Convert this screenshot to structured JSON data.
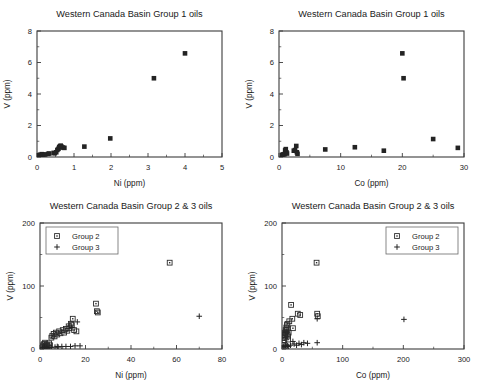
{
  "figure": {
    "width": 483,
    "height": 386,
    "background": "#ffffff",
    "marker_color": "#232323",
    "axis_color": "#3b3b3b"
  },
  "chart_data": [
    {
      "id": "panel-top-left",
      "type": "scatter",
      "title": "Western Canada Basin Group 1 oils",
      "xlabel": "Ni (ppm)",
      "ylabel": "V (ppm)",
      "xlim": [
        0,
        5
      ],
      "ylim": [
        0,
        8
      ],
      "xticks": [
        0,
        1,
        2,
        3,
        4,
        5
      ],
      "yticks": [
        0,
        2,
        4,
        6,
        8
      ],
      "xticklabels": [
        "0",
        "1",
        "2",
        "3",
        "4",
        "5"
      ],
      "yticklabels": [
        "0",
        "2",
        "4",
        "6",
        "8"
      ],
      "xminor_count": 1,
      "yminor_count": 1,
      "grid": false,
      "legend": null,
      "series": [
        {
          "name": "Group 1",
          "marker": "filled-square",
          "points": [
            [
              0.05,
              0.12
            ],
            [
              0.09,
              0.14
            ],
            [
              0.13,
              0.18
            ],
            [
              0.17,
              0.15
            ],
            [
              0.22,
              0.16
            ],
            [
              0.3,
              0.2
            ],
            [
              0.33,
              0.22
            ],
            [
              0.45,
              0.26
            ],
            [
              0.48,
              0.24
            ],
            [
              0.52,
              0.3
            ],
            [
              0.55,
              0.45
            ],
            [
              0.58,
              0.52
            ],
            [
              0.6,
              0.62
            ],
            [
              0.62,
              0.68
            ],
            [
              0.64,
              0.72
            ],
            [
              0.66,
              0.66
            ],
            [
              0.7,
              0.6
            ],
            [
              0.74,
              0.58
            ],
            [
              1.28,
              0.66
            ],
            [
              1.98,
              1.18
            ],
            [
              3.16,
              5.0
            ],
            [
              4.0,
              6.58
            ]
          ]
        }
      ]
    },
    {
      "id": "panel-top-right",
      "type": "scatter",
      "title": "Western Canada Basin Group 1 oils",
      "xlabel": "Co (ppm)",
      "ylabel": "V (ppm)",
      "xlim": [
        0,
        30
      ],
      "ylim": [
        0,
        8
      ],
      "xticks": [
        0,
        10,
        20,
        30
      ],
      "yticks": [
        0,
        2,
        4,
        6,
        8
      ],
      "xticklabels": [
        "0",
        "10",
        "20",
        "30"
      ],
      "yticklabels": [
        "0",
        "2",
        "4",
        "6",
        "8"
      ],
      "xminor_count": 1,
      "yminor_count": 1,
      "grid": false,
      "legend": null,
      "series": [
        {
          "name": "Group 1",
          "marker": "filled-square",
          "points": [
            [
              0.5,
              0.14
            ],
            [
              0.7,
              0.16
            ],
            [
              0.9,
              0.18
            ],
            [
              1.0,
              0.42
            ],
            [
              1.1,
              0.5
            ],
            [
              1.2,
              0.3
            ],
            [
              1.3,
              0.22
            ],
            [
              2.4,
              0.4
            ],
            [
              2.6,
              0.44
            ],
            [
              2.8,
              0.7
            ],
            [
              2.9,
              0.3
            ],
            [
              3.0,
              0.2
            ],
            [
              7.5,
              0.48
            ],
            [
              12.3,
              0.62
            ],
            [
              17.0,
              0.4
            ],
            [
              20.0,
              6.58
            ],
            [
              20.2,
              5.0
            ],
            [
              25.0,
              1.14
            ],
            [
              29.0,
              0.58
            ]
          ]
        }
      ]
    },
    {
      "id": "panel-bottom-left",
      "type": "scatter",
      "title": "Western Canada Basin Group 2 & 3 oils",
      "xlabel": "Ni (ppm)",
      "ylabel": "V (ppm)",
      "xlim": [
        0,
        80
      ],
      "ylim": [
        0,
        200
      ],
      "xticks": [
        0,
        20,
        40,
        60,
        80
      ],
      "yticks": [
        0,
        100,
        200
      ],
      "xticklabels": [
        "0",
        "20",
        "40",
        "60",
        "80"
      ],
      "yticklabels": [
        "0",
        "100",
        "200"
      ],
      "xminor_count": 1,
      "yminor_count": 1,
      "grid": false,
      "legend": {
        "position": "top-left",
        "entries": [
          {
            "label": "Group 2",
            "marker": "open-square"
          },
          {
            "label": "Group 3",
            "marker": "plus"
          }
        ]
      },
      "series": [
        {
          "name": "Group 2",
          "marker": "open-square",
          "points": [
            [
              1.0,
              4
            ],
            [
              1.4,
              6
            ],
            [
              1.8,
              8
            ],
            [
              2.0,
              3
            ],
            [
              2.2,
              10
            ],
            [
              2.6,
              5
            ],
            [
              3.0,
              7
            ],
            [
              3.4,
              4
            ],
            [
              4.0,
              9
            ],
            [
              4.4,
              6
            ],
            [
              5.0,
              18
            ],
            [
              5.4,
              21
            ],
            [
              6.0,
              24
            ],
            [
              6.4,
              20
            ],
            [
              7.0,
              26
            ],
            [
              7.6,
              23
            ],
            [
              8.4,
              28
            ],
            [
              9.0,
              25
            ],
            [
              10.0,
              30
            ],
            [
              10.6,
              26
            ],
            [
              11.4,
              32
            ],
            [
              12.0,
              29
            ],
            [
              12.6,
              36
            ],
            [
              13.0,
              33
            ],
            [
              13.6,
              40
            ],
            [
              14.0,
              38
            ],
            [
              14.4,
              48
            ],
            [
              15.0,
              30
            ],
            [
              16.0,
              28
            ],
            [
              24.6,
              72
            ],
            [
              25.0,
              60
            ],
            [
              25.4,
              58
            ],
            [
              57.0,
              137
            ]
          ]
        },
        {
          "name": "Group 3",
          "marker": "plus",
          "points": [
            [
              1.2,
              2
            ],
            [
              2.0,
              3
            ],
            [
              3.0,
              2
            ],
            [
              4.0,
              3
            ],
            [
              5.0,
              2
            ],
            [
              6.6,
              3
            ],
            [
              7.6,
              4
            ],
            [
              8.0,
              3
            ],
            [
              9.6,
              4
            ],
            [
              11.4,
              4
            ],
            [
              13.4,
              4
            ],
            [
              15.4,
              5
            ],
            [
              17.6,
              5
            ],
            [
              14.0,
              34
            ],
            [
              16.4,
              43
            ],
            [
              70.0,
              52
            ]
          ]
        }
      ]
    },
    {
      "id": "panel-bottom-right",
      "type": "scatter",
      "title": "Western Canada Basin Group 2 & 3 oils",
      "xlabel": "Co (ppm)",
      "ylabel": "V (ppm)",
      "xlim": [
        0,
        300
      ],
      "ylim": [
        0,
        200
      ],
      "xticks": [
        0,
        100,
        200,
        300
      ],
      "yticks": [
        0,
        100,
        200
      ],
      "xticklabels": [
        "0",
        "100",
        "200",
        "300"
      ],
      "yticklabels": [
        "0",
        "100",
        "200"
      ],
      "xminor_count": 1,
      "yminor_count": 1,
      "grid": false,
      "legend": {
        "position": "top-right",
        "entries": [
          {
            "label": "Group 2",
            "marker": "open-square"
          },
          {
            "label": "Group 3",
            "marker": "plus"
          }
        ]
      },
      "series": [
        {
          "name": "Group 2",
          "marker": "open-square",
          "points": [
            [
              2,
              6
            ],
            [
              3,
              10
            ],
            [
              3,
              18
            ],
            [
              4,
              22
            ],
            [
              4,
              14
            ],
            [
              5,
              26
            ],
            [
              5,
              20
            ],
            [
              6,
              30
            ],
            [
              6,
              24
            ],
            [
              7,
              34
            ],
            [
              7,
              28
            ],
            [
              8,
              38
            ],
            [
              8,
              31
            ],
            [
              9,
              40
            ],
            [
              9,
              23
            ],
            [
              10,
              20
            ],
            [
              10,
              15
            ],
            [
              11,
              26
            ],
            [
              12,
              44
            ],
            [
              15,
              70
            ],
            [
              17,
              48
            ],
            [
              18,
              33
            ],
            [
              26,
              56
            ],
            [
              30,
              54
            ],
            [
              57,
              137
            ],
            [
              58,
              56
            ],
            [
              59,
              52
            ]
          ]
        },
        {
          "name": "Group 3",
          "marker": "plus",
          "points": [
            [
              3,
              4
            ],
            [
              5,
              5
            ],
            [
              7,
              4
            ],
            [
              9,
              5
            ],
            [
              11,
              4
            ],
            [
              14,
              6
            ],
            [
              18,
              12
            ],
            [
              20,
              8
            ],
            [
              24,
              6
            ],
            [
              28,
              9
            ],
            [
              32,
              7
            ],
            [
              36,
              10
            ],
            [
              42,
              9
            ],
            [
              58,
              10
            ],
            [
              58,
              48
            ],
            [
              201,
              47
            ]
          ]
        }
      ]
    }
  ]
}
